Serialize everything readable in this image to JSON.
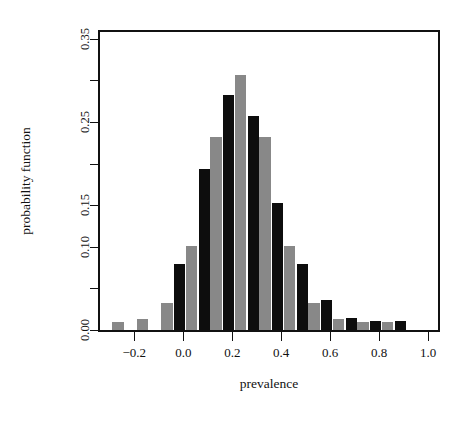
{
  "chart_data": {
    "type": "bar",
    "title": "",
    "xlabel": "prevalence",
    "ylabel": "probability function",
    "xlim": [
      -0.34,
      1.04
    ],
    "ylim": [
      0.0,
      0.358
    ],
    "grid": false,
    "legend": "none",
    "bar_width": 0.046,
    "x": [
      -0.29,
      -0.19,
      -0.09,
      0.01,
      0.11,
      0.21,
      0.31,
      0.41,
      0.51,
      0.61,
      0.71,
      0.81,
      0.91
    ],
    "xtick_values": [
      -0.2,
      0.0,
      0.2,
      0.4,
      0.6,
      0.8,
      1.0
    ],
    "xtick_labels": [
      "-0.2",
      "0.0",
      "0.2",
      "0.4",
      "0.6",
      "0.8",
      "1.0"
    ],
    "ytick_values": [
      0.0,
      0.05,
      0.1,
      0.15,
      0.2,
      0.25,
      0.3,
      0.35
    ],
    "ytick_labels": [
      "0.00",
      "",
      "0.10",
      "0.15",
      "",
      "0.25",
      "",
      "0.35"
    ],
    "series": [
      {
        "name": "black",
        "color": "#0d0d0d",
        "offset": -0.024,
        "values": [
          0.0,
          0.0,
          0.0,
          0.079,
          0.194,
          0.282,
          0.257,
          0.152,
          0.079,
          0.036,
          0.014,
          0.011,
          0.011
        ]
      },
      {
        "name": "gray",
        "color": "#888888",
        "offset": 0.024,
        "values": [
          0.01,
          0.013,
          0.032,
          0.101,
          0.232,
          0.306,
          0.232,
          0.101,
          0.032,
          0.013,
          0.01,
          0.01,
          0.0
        ]
      }
    ]
  },
  "axes": {
    "x_title": "prevalence",
    "y_title": "probability function"
  }
}
